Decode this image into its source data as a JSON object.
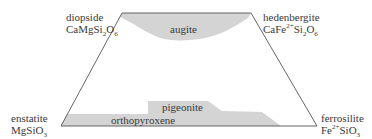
{
  "diagram": {
    "type": "pyroxene quadrilateral",
    "colors": {
      "outline": "#555555",
      "fill": "#d4d4d4",
      "text": "#3a3a3a"
    },
    "endmembers": {
      "top_left": {
        "name": "diopside",
        "formula_parts": [
          "CaMgSi",
          "2",
          "O",
          "6"
        ]
      },
      "top_right": {
        "name": "hedenbergite",
        "formula_parts": [
          "CaFe",
          "2+",
          "Si",
          "2",
          "O",
          "6"
        ]
      },
      "bottom_left": {
        "name": "enstatite",
        "formula_parts": [
          "MgSiO",
          "3"
        ]
      },
      "bottom_right": {
        "name": "ferrosilite",
        "formula_parts": [
          "Fe",
          "2+",
          "SiO",
          "3"
        ]
      }
    },
    "regions": [
      {
        "id": "augite",
        "label": "augite"
      },
      {
        "id": "pigeonite",
        "label": "pigeonite"
      },
      {
        "id": "orthopyroxene",
        "label": "orthopyroxene"
      }
    ]
  }
}
